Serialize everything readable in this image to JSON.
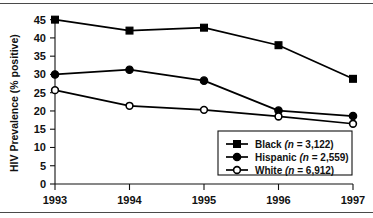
{
  "chart_data": {
    "type": "line",
    "title": "",
    "xlabel": "",
    "ylabel": "HIV Prevalence (% positive)",
    "x": [
      1993,
      1994,
      1995,
      1996,
      1997
    ],
    "xticklabels": [
      "1993",
      "1994",
      "1995",
      "1996",
      "1997"
    ],
    "yticks": [
      0,
      5,
      10,
      15,
      20,
      25,
      30,
      35,
      40,
      45
    ],
    "yticklabels": [
      "0",
      "5",
      "10",
      "15",
      "20",
      "25",
      "30",
      "35",
      "40",
      "45"
    ],
    "ylim": [
      0,
      46
    ],
    "xlim": [
      1993,
      1997
    ],
    "grid": false,
    "legend_position": "bottom-right",
    "series": [
      {
        "name": "Black",
        "legend_label": "Black (n = 3,122)",
        "legend_name": "Black",
        "legend_n": "(n = 3,122)",
        "n": 3122,
        "marker": "filled-square",
        "color": "#000000",
        "values": [
          45.0,
          42.0,
          42.8,
          38.0,
          28.8
        ]
      },
      {
        "name": "Hispanic",
        "legend_label": "Hispanic (n = 2,559)",
        "legend_name": "Hispanic",
        "legend_n": "(n = 2,559)",
        "n": 2559,
        "marker": "filled-circle",
        "color": "#000000",
        "values": [
          30.0,
          31.3,
          28.3,
          20.1,
          18.6
        ]
      },
      {
        "name": "White",
        "legend_label": "White (n = 6,912)",
        "legend_name": "White",
        "legend_n": "(n = 6,912)",
        "n": 6912,
        "marker": "open-circle",
        "color": "#000000",
        "values": [
          25.7,
          21.4,
          20.3,
          18.5,
          16.5
        ]
      }
    ]
  }
}
